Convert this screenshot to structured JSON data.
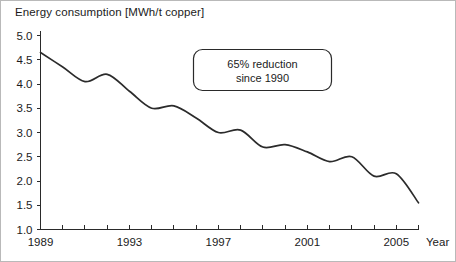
{
  "chart_data": {
    "type": "line",
    "title": "Energy consumption [MWh/t copper]",
    "xlabel": "Year",
    "ylabel": "Energy consumption [MWh/t copper]",
    "xlim": [
      1989,
      2006
    ],
    "ylim": [
      1.0,
      5.0
    ],
    "grid": false,
    "legend": "none",
    "x_tick_labels": [
      "1989",
      "1993",
      "1997",
      "2001",
      "2005"
    ],
    "x_tick_values": [
      1989,
      1993,
      1997,
      2001,
      2005
    ],
    "x_minor_tick_values": [
      1989,
      1990,
      1991,
      1992,
      1993,
      1994,
      1995,
      1996,
      1997,
      1998,
      1999,
      2000,
      2001,
      2002,
      2003,
      2004,
      2005,
      2006
    ],
    "y_tick_labels": [
      "1.0",
      "1.5",
      "2.0",
      "2.5",
      "3.0",
      "3.5",
      "4.0",
      "4.5",
      "5.0"
    ],
    "y_tick_values": [
      1.0,
      1.5,
      2.0,
      2.5,
      3.0,
      3.5,
      4.0,
      4.5,
      5.0
    ],
    "series": [
      {
        "name": "Energy consumption",
        "x": [
          1989,
          1990,
          1991,
          1992,
          1993,
          1994,
          1995,
          1996,
          1997,
          1998,
          1999,
          2000,
          2001,
          2002,
          2003,
          2004,
          2005,
          2006
        ],
        "values": [
          4.65,
          4.35,
          4.05,
          4.2,
          3.85,
          3.5,
          3.55,
          3.3,
          3.0,
          3.05,
          2.7,
          2.75,
          2.6,
          2.4,
          2.5,
          2.1,
          2.15,
          1.55
        ],
        "color": "#2b2b2b"
      }
    ],
    "annotations": [
      {
        "name": "reduction-callout",
        "line1": "65% reduction",
        "line2": "since 1990"
      }
    ]
  },
  "annotation": {
    "line1": "65% reduction",
    "line2": "since 1990"
  },
  "axis": {
    "year_label": "Year"
  }
}
